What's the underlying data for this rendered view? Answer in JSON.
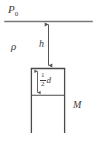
{
  "figure": {
    "type": "fluid-statics-diagram",
    "width": 96,
    "height": 147,
    "background_color": "#ffffff",
    "line_color": "#555555",
    "text_color": "#3c3c3c"
  },
  "labels": {
    "ambient_pressure": "P",
    "ambient_pressure_subscript": "0",
    "density": "ρ",
    "depth": "h",
    "mass": "M",
    "half_depth_numerator": "1",
    "half_depth_denominator": "2",
    "half_depth_symbol": "d"
  },
  "geometry": {
    "free_surface_line": {
      "x1": 5,
      "y1": 21,
      "x2": 92,
      "y2": 21
    },
    "depth_arrow": {
      "x": 48,
      "y_top": 22,
      "y_bottom": 68,
      "double_headed": true
    },
    "block": {
      "left": 31,
      "right": 65,
      "top": 68,
      "bottom": 133
    },
    "inner_divider_line": {
      "x1": 31,
      "y1": 95,
      "x2": 65,
      "y2": 95
    },
    "half_depth_arrow": {
      "x": 37,
      "y_top": 69,
      "y_bottom": 94,
      "double_headed": true
    }
  },
  "icons": {
    "arrow_up": "arrow-up-icon",
    "arrow_down": "arrow-down-icon"
  }
}
